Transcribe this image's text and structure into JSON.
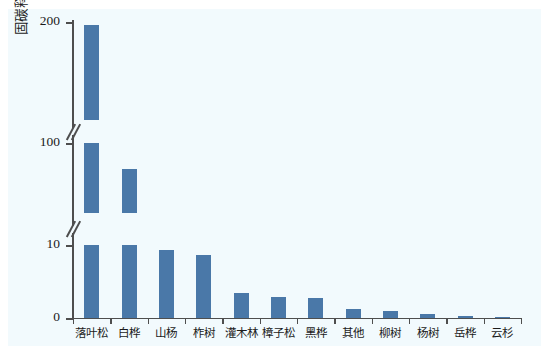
{
  "chart_data": {
    "type": "bar",
    "title": "",
    "xlabel": "",
    "ylabel": "固碳释氧（亿元/年）",
    "categories": [
      "落叶松",
      "白桦",
      "山杨",
      "柞树",
      "灌木林",
      "樟子松",
      "黑桦",
      "其他",
      "柳树",
      "杨树",
      "岳桦",
      "云杉"
    ],
    "values": [
      197,
      67,
      9.3,
      8.6,
      3.4,
      2.9,
      2.8,
      1.3,
      1.0,
      0.5,
      0.3,
      0.05
    ],
    "ytick_labels": [
      "0",
      "10",
      "100",
      "200"
    ],
    "ytick_values": [
      0,
      10,
      100,
      200
    ],
    "ylim": [
      0,
      200
    ],
    "axis_broken": true,
    "axis_break_count": 2,
    "grid": false,
    "legend": false,
    "bar_color": "#4a78a8",
    "axis_color": "#4e4e4e",
    "background_color": "#f2fafd"
  },
  "figure": {
    "y_axis_label": "固碳释氧（亿元/年）",
    "axis_break_glyph": "//"
  }
}
